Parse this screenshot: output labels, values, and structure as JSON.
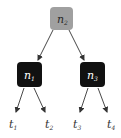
{
  "diagram": {
    "type": "binary-tree",
    "colors": {
      "root_fill": "#a0a0a0",
      "inner_fill": "#111111",
      "root_text": "#2a2a2a",
      "inner_text": "#ffffff",
      "edge": "#333333",
      "leaf_text": "#333333"
    },
    "nodes": [
      {
        "id": "n2",
        "base": "n",
        "sub": "2",
        "role": "root"
      },
      {
        "id": "n1",
        "base": "n",
        "sub": "1",
        "role": "internal"
      },
      {
        "id": "n3",
        "base": "n",
        "sub": "3",
        "role": "internal"
      }
    ],
    "leaves": [
      {
        "id": "t1",
        "base": "t",
        "sub": "1"
      },
      {
        "id": "t2",
        "base": "t",
        "sub": "2"
      },
      {
        "id": "t3",
        "base": "t",
        "sub": "3"
      },
      {
        "id": "t4",
        "base": "t",
        "sub": "4"
      }
    ],
    "edges": [
      [
        "n2",
        "n1"
      ],
      [
        "n2",
        "n3"
      ],
      [
        "n1",
        "t1"
      ],
      [
        "n1",
        "t2"
      ],
      [
        "n3",
        "t3"
      ],
      [
        "n3",
        "t4"
      ]
    ]
  }
}
